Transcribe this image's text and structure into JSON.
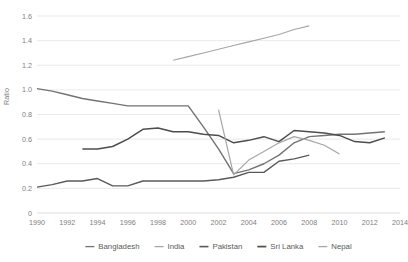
{
  "chart_data": {
    "type": "line",
    "title": "",
    "xlabel": "",
    "ylabel": "Ratio",
    "xlim": [
      1990,
      2014
    ],
    "ylim": [
      0,
      1.6
    ],
    "ytick_labels": [
      "0",
      "0.2",
      "0.4",
      "0.6",
      "0.8",
      "1.0",
      "1.2",
      "1.4",
      "1.6"
    ],
    "ytick_values": [
      0,
      0.2,
      0.4,
      0.6,
      0.8,
      1.0,
      1.2,
      1.4,
      1.6
    ],
    "xtick_labels": [
      "1990",
      "1992",
      "1994",
      "1996",
      "1998",
      "2000",
      "2002",
      "2004",
      "2006",
      "2008",
      "2010",
      "2012",
      "2014"
    ],
    "xtick_values": [
      1990,
      1992,
      1994,
      1996,
      1998,
      2000,
      2002,
      2004,
      2006,
      2008,
      2010,
      2012,
      2014
    ],
    "grid": true,
    "legend_position": "bottom",
    "series": [
      {
        "name": "Bangladesh",
        "color": "#737373",
        "width": 1.4,
        "x": [
          1990,
          1991,
          1992,
          1993,
          1994,
          1995,
          1996,
          1997,
          1998,
          1999,
          2000,
          2001,
          2002,
          2003,
          2004,
          2005,
          2006,
          2007,
          2008,
          2009,
          2010,
          2011,
          2012,
          2013
        ],
        "y": [
          1.01,
          0.99,
          0.96,
          0.93,
          0.91,
          0.89,
          0.87,
          0.87,
          0.87,
          0.87,
          0.87,
          0.7,
          0.52,
          0.32,
          0.35,
          0.4,
          0.47,
          0.57,
          0.62,
          0.63,
          0.64,
          0.64,
          0.65,
          0.66
        ]
      },
      {
        "name": "India",
        "color": "#a6a6a6",
        "width": 1.1,
        "x": [
          1999,
          2000,
          2001,
          2002,
          2003,
          2004,
          2005,
          2006,
          2007,
          2008
        ],
        "y": [
          1.24,
          1.27,
          1.3,
          1.33,
          1.36,
          1.39,
          1.42,
          1.45,
          1.49,
          1.52
        ]
      },
      {
        "name": "Pakistan",
        "color": "#5a5a5a",
        "width": 1.4,
        "x": [
          1990,
          1991,
          1992,
          1993,
          1994,
          1995,
          1996,
          1997,
          1998,
          1999,
          2000,
          2001,
          2002,
          2003,
          2004,
          2005,
          2006,
          2007,
          2008
        ],
        "y": [
          0.21,
          0.23,
          0.26,
          0.26,
          0.28,
          0.22,
          0.22,
          0.26,
          0.26,
          0.26,
          0.26,
          0.26,
          0.27,
          0.29,
          0.33,
          0.33,
          0.42,
          0.44,
          0.47
        ]
      },
      {
        "name": "Sri Lanka",
        "color": "#4d4d4d",
        "width": 1.5,
        "x": [
          1993,
          1994,
          1995,
          1996,
          1997,
          1998,
          1999,
          2000,
          2001,
          2002,
          2003,
          2004,
          2005,
          2006,
          2007,
          2008,
          2009,
          2010,
          2011,
          2012,
          2013
        ],
        "y": [
          0.52,
          0.52,
          0.54,
          0.6,
          0.68,
          0.69,
          0.66,
          0.66,
          0.64,
          0.63,
          0.57,
          0.59,
          0.62,
          0.58,
          0.67,
          0.66,
          0.65,
          0.63,
          0.58,
          0.57,
          0.61
        ]
      },
      {
        "name": "Nepal",
        "color": "#a6a6a6",
        "width": 1.2,
        "x": [
          2002,
          2003,
          2004,
          2005,
          2006,
          2007,
          2008,
          2009,
          2010
        ],
        "y": [
          0.84,
          0.31,
          0.43,
          0.5,
          0.57,
          0.62,
          0.59,
          0.55,
          0.48
        ]
      }
    ]
  },
  "legend": {
    "items": [
      {
        "label": "Bangladesh",
        "color": "#737373"
      },
      {
        "label": "India",
        "color": "#a6a6a6"
      },
      {
        "label": "Pakistan",
        "color": "#5a5a5a"
      },
      {
        "label": "Sri Lanka",
        "color": "#4d4d4d"
      },
      {
        "label": "Nepal",
        "color": "#a6a6a6"
      }
    ]
  }
}
